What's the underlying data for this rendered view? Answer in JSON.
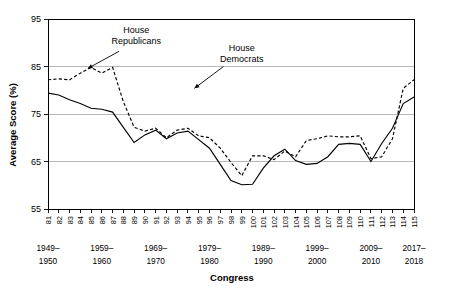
{
  "chart_data": {
    "type": "line",
    "title": "",
    "xlabel": "Congress",
    "ylabel": "Average Score (%)",
    "ylim": [
      55,
      95
    ],
    "yticks": [
      55,
      65,
      75,
      85,
      95
    ],
    "grid": "horizontal",
    "legend_position": "inline-annotations",
    "x": [
      81,
      82,
      83,
      84,
      85,
      86,
      87,
      88,
      89,
      90,
      91,
      92,
      93,
      94,
      95,
      96,
      97,
      98,
      99,
      100,
      101,
      102,
      103,
      104,
      105,
      106,
      107,
      108,
      109,
      110,
      111,
      112,
      113,
      114,
      115
    ],
    "xtick_labels": [
      "81",
      "82",
      "83",
      "84",
      "85",
      "86",
      "87",
      "88",
      "89",
      "90",
      "91",
      "92",
      "93",
      "94",
      "95",
      "96",
      "97",
      "98",
      "99",
      "100",
      "101",
      "102",
      "103",
      "104",
      "105",
      "106",
      "107",
      "108",
      "109",
      "110",
      "111",
      "112",
      "113",
      "114",
      "115"
    ],
    "decade_labels": [
      {
        "top": "1949–",
        "bottom": "1950",
        "at_x": 81
      },
      {
        "top": "1959–",
        "bottom": "1960",
        "at_x": 86
      },
      {
        "top": "1969–",
        "bottom": "1970",
        "at_x": 91
      },
      {
        "top": "1979–",
        "bottom": "1980",
        "at_x": 96
      },
      {
        "top": "1989–",
        "bottom": "1990",
        "at_x": 101
      },
      {
        "top": "1999–",
        "bottom": "2000",
        "at_x": 106
      },
      {
        "top": "2009–",
        "bottom": "2010",
        "at_x": 111
      },
      {
        "top": "2017–",
        "bottom": "2018",
        "at_x": 115
      }
    ],
    "series": [
      {
        "name": "House Republicans",
        "style": "dashed",
        "label_lines": [
          "House",
          "Republicans"
        ],
        "label_x": 89.2,
        "label_y": 92.0,
        "arrow_from_x": 87.6,
        "arrow_from_y": 88.2,
        "arrow_to_x": 84.7,
        "arrow_to_y": 84.6,
        "values": [
          82.2,
          82.4,
          82.2,
          83.6,
          84.8,
          83.6,
          84.8,
          77.6,
          72.2,
          71.4,
          72.0,
          70.0,
          71.6,
          72.0,
          70.4,
          70.0,
          67.8,
          64.8,
          62.0,
          66.2,
          66.2,
          65.4,
          67.2,
          66.0,
          69.4,
          69.8,
          70.4,
          70.2,
          70.2,
          70.4,
          65.6,
          66.0,
          69.8,
          80.4,
          82.2
        ]
      },
      {
        "name": "House Democrats",
        "style": "solid",
        "label_lines": [
          "House",
          "Democrats"
        ],
        "label_x": 99.0,
        "label_y": 88.2,
        "arrow_from_x": 97.3,
        "arrow_from_y": 85.0,
        "arrow_to_x": 94.6,
        "arrow_to_y": 80.4,
        "values": [
          79.4,
          79.0,
          78.0,
          77.2,
          76.2,
          76.0,
          75.4,
          72.2,
          69.0,
          70.6,
          71.6,
          69.8,
          71.0,
          71.4,
          69.6,
          67.8,
          64.4,
          61.0,
          60.1,
          60.2,
          63.6,
          66.2,
          67.6,
          65.2,
          64.4,
          64.6,
          66.0,
          68.6,
          68.8,
          68.6,
          65.0,
          68.8,
          72.0,
          77.2,
          78.6
        ]
      }
    ],
    "series_overrides": {
      "note": "values listed above are read from the plotted curve at each Congress tick"
    }
  },
  "axis": {
    "y_title": "Average Score (%)",
    "x_title": "Congress"
  }
}
